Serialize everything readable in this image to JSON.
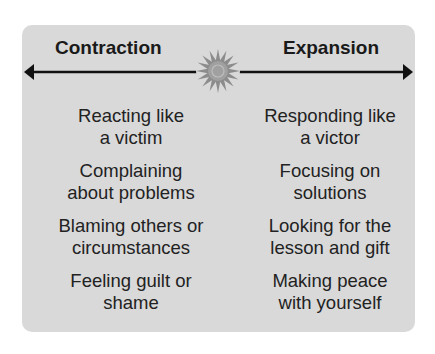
{
  "diagram": {
    "left_heading": "Contraction",
    "right_heading": "Expansion",
    "center_icon": "sun-icon",
    "left_items": [
      {
        "line1": "Reacting like",
        "line2": "a victim"
      },
      {
        "line1": "Complaining",
        "line2": "about problems"
      },
      {
        "line1": "Blaming others or",
        "line2": "circumstances"
      },
      {
        "line1": "Feeling guilt or",
        "line2": "shame"
      }
    ],
    "right_items": [
      {
        "line1": "Responding like",
        "line2": "a victor"
      },
      {
        "line1": "Focusing on",
        "line2": "solutions"
      },
      {
        "line1": "Looking for the",
        "line2": "lesson and gift"
      },
      {
        "line1": "Making peace",
        "line2": "with yourself"
      }
    ],
    "colors": {
      "panel": "#d9d9d9",
      "text": "#222222",
      "arrow": "#111111",
      "sun": "#8c8c8c"
    }
  }
}
